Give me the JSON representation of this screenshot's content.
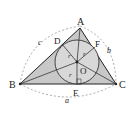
{
  "diagram": {
    "vertices": {
      "A": "A",
      "B": "B",
      "C": "C"
    },
    "tangent_points": {
      "D": "D",
      "E": "E",
      "F": "F"
    },
    "center": "O",
    "radius_labels": [
      "r",
      "r",
      "r"
    ],
    "side_labels": {
      "a": "a",
      "b": "b",
      "c": "c"
    },
    "colors": {
      "fill": "#c8c8c8",
      "stroke": "#222222",
      "dashed": "#888888"
    }
  }
}
